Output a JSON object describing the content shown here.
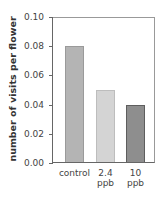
{
  "chart_data": {
    "type": "bar",
    "title": "",
    "xlabel": "",
    "ylabel": "number of visits per flower",
    "categories": [
      "control",
      "2.4 ppb",
      "10 ppb"
    ],
    "category_lines": [
      [
        "control",
        ""
      ],
      [
        "2.4",
        "ppb"
      ],
      [
        "10",
        "ppb"
      ]
    ],
    "values": [
      0.08,
      0.05,
      0.04
    ],
    "bar_colors": [
      "#b4b4b4",
      "#d4d4d4",
      "#8e8e8e"
    ],
    "bar_border_colors": [
      "#9a9a9a",
      "#bdbdbd",
      "#5e5e5e"
    ],
    "ylim": [
      0,
      0.1
    ],
    "yticks": [
      "0.00",
      "0.02",
      "0.04",
      "0.06",
      "0.08",
      "0.10"
    ],
    "grid": false,
    "legend": null
  }
}
